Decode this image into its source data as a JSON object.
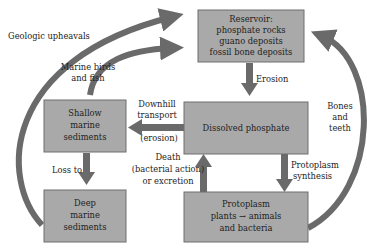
{
  "diagram": {
    "nodes": {
      "reservoir": [
        "Reservoir:",
        "phosphate rocks",
        "guano deposits",
        "fossil bone deposits"
      ],
      "dissolved": [
        "Dissolved phosphate"
      ],
      "shallow": [
        "Shallow",
        "marine",
        "sediments"
      ],
      "deep": [
        "Deep",
        "marine",
        "sediments"
      ],
      "protoplasm": [
        "Protoplasm",
        "plants → animals",
        "and bacteria"
      ]
    },
    "edges": {
      "geologic": [
        "Geologic upheavals"
      ],
      "birds": [
        "Marine birds",
        "and fish"
      ],
      "erosion": [
        "Erosion"
      ],
      "downhill": [
        "Downhill",
        "transport",
        "(erosion)"
      ],
      "death": [
        "Death",
        "(bacterial action)",
        "or excretion"
      ],
      "synthesis": [
        "Protoplasm",
        "synthesis"
      ],
      "loss": [
        "Loss to"
      ],
      "bones": [
        "Bones",
        "and",
        "teeth"
      ]
    }
  }
}
